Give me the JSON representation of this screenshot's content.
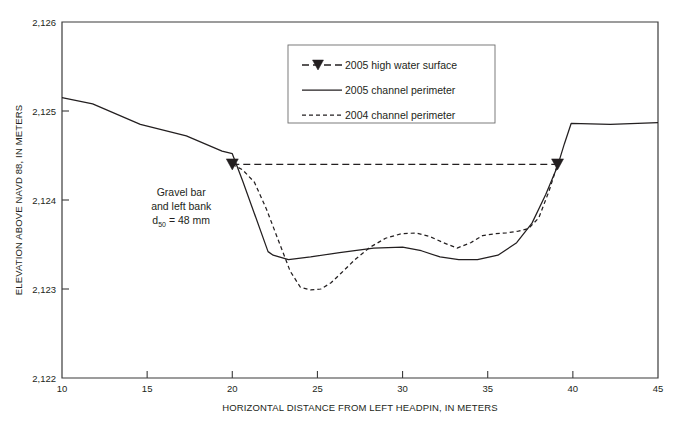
{
  "chart_data": {
    "type": "line",
    "title": "",
    "xlabel": "HORIZONTAL DISTANCE FROM LEFT HEADPIN, IN METERS",
    "ylabel": "ELEVATION ABOVE NAVD 88, IN METERS",
    "xlim": [
      10,
      45
    ],
    "ylim": [
      2122,
      2126
    ],
    "xticks": [
      10,
      15,
      20,
      25,
      30,
      35,
      40,
      45
    ],
    "xtick_labels": [
      "10",
      "15",
      "20",
      "25",
      "30",
      "35",
      "40",
      "45"
    ],
    "yticks": [
      2122,
      2123,
      2124,
      2125,
      2126
    ],
    "ytick_labels": [
      "2,122",
      "2,123",
      "2,124",
      "2,125",
      "2,126"
    ],
    "grid": false,
    "legend_position": "top-center-right",
    "series": [
      {
        "name": "2005 high water surface",
        "style": "dashed-with-markers",
        "x": [
          20.0,
          39.1
        ],
        "y": [
          2124.4,
          2124.4
        ],
        "markers": [
          {
            "x": 20.0,
            "y": 2124.4
          },
          {
            "x": 39.1,
            "y": 2124.4
          }
        ]
      },
      {
        "name": "2005 channel perimeter",
        "style": "solid",
        "x": [
          10.0,
          11.8,
          14.6,
          17.3,
          19.4,
          20.0,
          20.6,
          22.1,
          22.4,
          23.3,
          24.6,
          26.3,
          28.3,
          30.0,
          31.1,
          32.2,
          33.3,
          34.4,
          35.6,
          36.7,
          37.6,
          38.4,
          39.1,
          39.5,
          39.9,
          42.2,
          45.0
        ],
        "y": [
          2125.15,
          2125.08,
          2124.85,
          2124.72,
          2124.55,
          2124.52,
          2124.22,
          2123.42,
          2123.38,
          2123.33,
          2123.36,
          2123.41,
          2123.46,
          2123.47,
          2123.43,
          2123.36,
          2123.33,
          2123.33,
          2123.38,
          2123.52,
          2123.74,
          2124.06,
          2124.38,
          2124.63,
          2124.86,
          2124.85,
          2124.87
        ]
      },
      {
        "name": "2004 channel perimeter",
        "style": "dashed",
        "x": [
          20.0,
          20.6,
          21.3,
          22.0,
          22.8,
          23.4,
          24.0,
          24.6,
          25.2,
          25.8,
          26.4,
          27.2,
          28.1,
          29.0,
          29.9,
          30.8,
          31.6,
          32.4,
          33.2,
          34.0,
          34.7,
          35.4,
          36.1,
          36.8,
          37.4,
          38.0,
          38.6,
          39.1
        ],
        "y": [
          2124.4,
          2124.34,
          2124.2,
          2123.9,
          2123.5,
          2123.2,
          2123.02,
          2122.99,
          2123.0,
          2123.07,
          2123.18,
          2123.33,
          2123.47,
          2123.57,
          2123.62,
          2123.63,
          2123.59,
          2123.52,
          2123.46,
          2123.52,
          2123.6,
          2123.62,
          2123.63,
          2123.65,
          2123.68,
          2123.8,
          2124.1,
          2124.4
        ]
      }
    ],
    "annotations": [
      {
        "name": "gravel-bar-note",
        "x": 17.0,
        "y": 2124.05,
        "lines": [
          "Gravel bar",
          "and left bank"
        ],
        "formula_prefix": "d",
        "formula_sub": "50",
        "formula_rest": " = 48 mm"
      }
    ]
  },
  "legend": {
    "items": [
      {
        "label": "2005 high water surface",
        "style": "dashed-with-markers"
      },
      {
        "label": "2005 channel perimeter",
        "style": "solid"
      },
      {
        "label": "2004 channel perimeter",
        "style": "dashed"
      }
    ]
  }
}
